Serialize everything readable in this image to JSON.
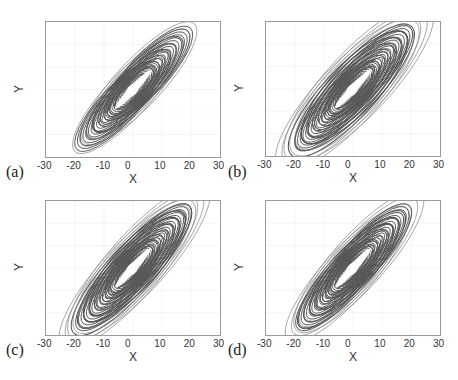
{
  "chart_data": [
    {
      "type": "line",
      "panel_label": "(a)",
      "xlabel": "X",
      "ylabel": "Y",
      "xlim": [
        -30,
        30
      ],
      "ylim": [
        -30,
        30
      ],
      "xticks": [
        "-30",
        "-20",
        "-10",
        "0",
        "10",
        "20",
        "30"
      ],
      "yticks": [
        "30",
        "20",
        "10",
        "0",
        "-10",
        "-20",
        "-30"
      ],
      "grid": true,
      "description": "Phase portrait (X vs Y) of chaotic attractor, elongated along diagonal",
      "extent": {
        "x": [
          -20,
          20
        ],
        "y": [
          -22,
          22
        ]
      },
      "orbits": {
        "rings": 14,
        "a_min": 8,
        "a_max": 28,
        "b_min": 2.5,
        "b_max": 8,
        "angle": 47,
        "outer_x": [
          19,
          -19
        ],
        "outer_y": [
          21,
          -21
        ]
      }
    },
    {
      "type": "line",
      "panel_label": "(b)",
      "xlabel": "X",
      "ylabel": "Y",
      "xlim": [
        -30,
        30
      ],
      "ylim": [
        -30,
        30
      ],
      "xticks": [
        "-30",
        "-20",
        "-10",
        "0",
        "10",
        "20",
        "30"
      ],
      "yticks": [
        "30",
        "20",
        "10",
        "0",
        "-10",
        "-20",
        "-30"
      ],
      "grid": true,
      "description": "Phase portrait (X vs Y) of chaotic attractor, wider spread",
      "extent": {
        "x": [
          -24,
          24
        ],
        "y": [
          -28,
          28
        ]
      },
      "orbits": {
        "rings": 20,
        "a_min": 8,
        "a_max": 36,
        "b_min": 2,
        "b_max": 11,
        "angle": 47,
        "outer_x": [
          24,
          -24
        ],
        "outer_y": [
          28,
          -28
        ]
      }
    },
    {
      "type": "line",
      "panel_label": "(c)",
      "xlabel": "X",
      "ylabel": "Y",
      "xlim": [
        -30,
        30
      ],
      "ylim": [
        -30,
        30
      ],
      "xticks": [
        "-30",
        "-20",
        "-10",
        "0",
        "10",
        "20",
        "30"
      ],
      "yticks": [
        "30",
        "20",
        "10",
        "0",
        "-10",
        "-20",
        "-30"
      ],
      "grid": true,
      "description": "Phase portrait (X vs Y) of chaotic attractor",
      "extent": {
        "x": [
          -23,
          23
        ],
        "y": [
          -28,
          28
        ]
      },
      "orbits": {
        "rings": 20,
        "a_min": 8,
        "a_max": 35,
        "b_min": 2,
        "b_max": 10,
        "angle": 48,
        "outer_x": [
          23,
          -23
        ],
        "outer_y": [
          28,
          -27
        ]
      }
    },
    {
      "type": "line",
      "panel_label": "(d)",
      "xlabel": "X",
      "ylabel": "Y",
      "xlim": [
        -30,
        30
      ],
      "ylim": [
        -30,
        30
      ],
      "xticks": [
        "-30",
        "-20",
        "-10",
        "0",
        "10",
        "20",
        "30"
      ],
      "yticks": [
        "30",
        "20",
        "10",
        "0",
        "-10",
        "-20",
        "-30"
      ],
      "grid": true,
      "description": "Phase portrait (X vs Y) of chaotic attractor",
      "extent": {
        "x": [
          -22,
          22
        ],
        "y": [
          -26,
          26
        ]
      },
      "orbits": {
        "rings": 18,
        "a_min": 8,
        "a_max": 32,
        "b_min": 2,
        "b_max": 9,
        "angle": 48,
        "outer_x": [
          21,
          -21
        ],
        "outer_y": [
          25,
          -25
        ]
      }
    }
  ],
  "panels": [
    {
      "label": "(a)",
      "x_axis_label": "X",
      "y_axis_label": "Y"
    },
    {
      "label": "(b)",
      "x_axis_label": "X",
      "y_axis_label": "Y"
    },
    {
      "label": "(c)",
      "x_axis_label": "X",
      "y_axis_label": "Y"
    },
    {
      "label": "(d)",
      "x_axis_label": "X",
      "y_axis_label": "Y"
    }
  ],
  "colors": {
    "trajectory": "#555555",
    "trajectory_light": "#8a8a8a",
    "grid": "#eeeeee",
    "axis": "#9a9a9a"
  }
}
